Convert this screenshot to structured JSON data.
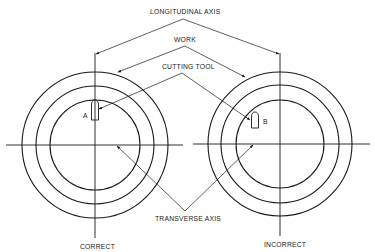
{
  "diagram": {
    "labels": {
      "longitudinal_axis": "LONGITUDINAL AXIS",
      "work": "WORK",
      "cutting_tool": "CUTTING TOOL",
      "transverse_axis": "TRANSVERSE AXIS"
    },
    "left_view": {
      "caption": "CORRECT",
      "tool_label": "A"
    },
    "right_view": {
      "caption": "INCORRECT",
      "tool_label": "B"
    },
    "colors": {
      "line": "#1a1a1a",
      "background": "#ffffff"
    }
  }
}
